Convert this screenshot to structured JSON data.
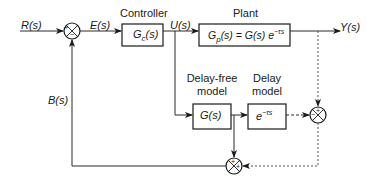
{
  "diagram": {
    "type": "smith-predictor-block-diagram",
    "signals": {
      "input": "R(s)",
      "error": "E(s)",
      "control": "U(s)",
      "output": "Y(s)",
      "feedback": "B(s)"
    },
    "blocks": {
      "controller": {
        "title": "Controller",
        "tf_main": "G",
        "tf_sub": "c",
        "tf_tail": "(s)"
      },
      "plant": {
        "title": "Plant",
        "tf_main": "G",
        "tf_sub": "p",
        "tf_tail": "(s) = G(s) e",
        "tf_sup": "−τs"
      },
      "delay_free_model": {
        "title_line1": "Delay-free",
        "title_line2": "model",
        "tf": "G(s)"
      },
      "delay_model": {
        "title_line1": "Delay",
        "title_line2": "model",
        "tf_base": "e",
        "tf_sup": "−τs"
      }
    },
    "summing_junctions": [
      {
        "id": "sum-error",
        "signs": [
          "+",
          "−"
        ]
      },
      {
        "id": "sum-model-error",
        "signs": [
          "+",
          "−"
        ]
      },
      {
        "id": "sum-feedback",
        "signs": [
          "+",
          "+"
        ]
      }
    ],
    "colors": {
      "line": "#2a2a2a",
      "dotted": "#555555",
      "background": "#ffffff"
    }
  }
}
